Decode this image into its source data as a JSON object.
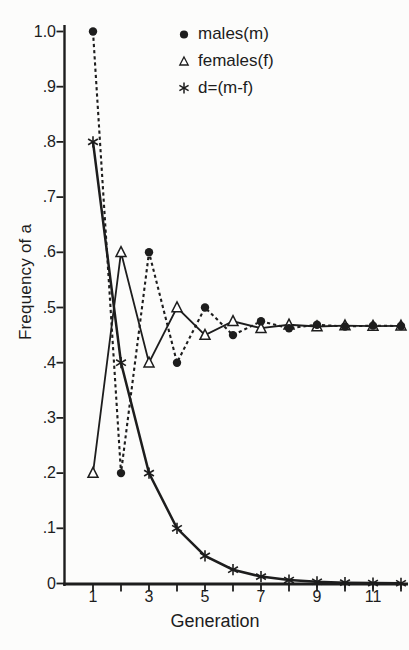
{
  "figure": {
    "background": "#fcfcfb",
    "ink": "#1d1d1d"
  },
  "legend": {
    "items": [
      {
        "label": "males(m)",
        "marker": "filled-circle"
      },
      {
        "label": "females(f)",
        "marker": "open-triangle"
      },
      {
        "label": "d=(m-f)",
        "marker": "asterisk"
      }
    ]
  },
  "chart_data": {
    "type": "line",
    "title": "",
    "xlabel": "Generation",
    "ylabel": "Frequency of a",
    "xlim": [
      0,
      12.3
    ],
    "ylim": [
      0,
      1.01
    ],
    "grid": false,
    "legend_position": "upper-center",
    "x": [
      1,
      2,
      3,
      4,
      5,
      6,
      7,
      8,
      9,
      10,
      11,
      12
    ],
    "x_ticks": [
      1,
      2,
      3,
      4,
      5,
      6,
      7,
      8,
      9,
      10,
      11,
      12
    ],
    "x_tick_labels": [
      {
        "value": 1,
        "label": "1"
      },
      {
        "value": 3,
        "label": "3"
      },
      {
        "value": 5,
        "label": "5"
      },
      {
        "value": 7,
        "label": "7"
      },
      {
        "value": 9,
        "label": "9"
      },
      {
        "value": 11,
        "label": "11"
      }
    ],
    "y_ticks": [
      {
        "value": 1.0,
        "label": "1.0"
      },
      {
        "value": 0.9,
        "label": ".9"
      },
      {
        "value": 0.8,
        "label": ".8"
      },
      {
        "value": 0.7,
        "label": ".7"
      },
      {
        "value": 0.6,
        "label": ".6"
      },
      {
        "value": 0.5,
        "label": ".5"
      },
      {
        "value": 0.4,
        "label": ".4"
      },
      {
        "value": 0.3,
        "label": ".3"
      },
      {
        "value": 0.2,
        "label": ".2"
      },
      {
        "value": 0.1,
        "label": ".1"
      },
      {
        "value": 0,
        "label": "0"
      }
    ],
    "series": [
      {
        "name": "males(m)",
        "marker": "filled-circle",
        "line_style": "dashed",
        "values": [
          1.0,
          0.2,
          0.6,
          0.4,
          0.5,
          0.45,
          0.475,
          0.4625,
          0.46875,
          0.465625,
          0.4671875,
          0.46640625
        ]
      },
      {
        "name": "females(f)",
        "marker": "open-triangle",
        "line_style": "solid",
        "values": [
          0.2,
          0.6,
          0.4,
          0.5,
          0.45,
          0.475,
          0.4625,
          0.46875,
          0.465625,
          0.4671875,
          0.46640625,
          0.466796875
        ]
      },
      {
        "name": "d=(m-f)",
        "marker": "asterisk",
        "line_style": "solid",
        "values": [
          0.8,
          0.4,
          0.2,
          0.1,
          0.05,
          0.025,
          0.0125,
          0.00625,
          0.003125,
          0.0015625,
          0.00078125,
          0.000390625
        ]
      }
    ]
  }
}
